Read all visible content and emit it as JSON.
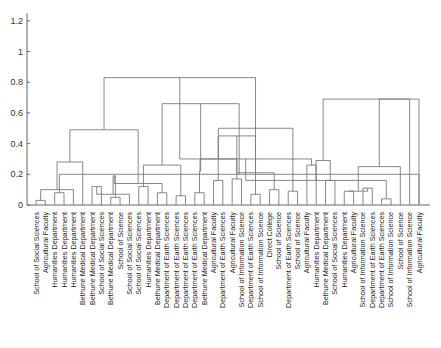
{
  "chart_data": {
    "type": "dendrogram",
    "title": "",
    "xlabel": "",
    "ylabel": "",
    "ylim": [
      0,
      1.25
    ],
    "yticks": [
      "0",
      "0.2",
      "0.4",
      "0.6",
      "0.8",
      "1",
      "1.2"
    ],
    "ytick_values": [
      0,
      0.2,
      0.4,
      0.6,
      0.8,
      1.0,
      1.2
    ],
    "grid": false,
    "leaves": [
      "School of Social Sciences",
      "Agricultural Faculty",
      "Humanities Department",
      "Humanities Department",
      "Humanities Department",
      "Bethune Medical Department",
      "Bethune Medical Department",
      "School of Social Sciences",
      "Bethune Medical Department",
      "School of Science",
      "School of Social Sciences",
      "School of Social Sciences",
      "Humanities Department",
      "Bethune Medical Department",
      "Department of Earth Sciences",
      "Department of Earth Sciences",
      "Department of Earth Sciences",
      "Department of Earth Sciences",
      "Bethune Medical Department",
      "Agricultural Faculty",
      "Department of Earth Sciences",
      "Agricultural Faculty",
      "School of Information Science",
      "Department of Earth Sciences",
      "School of Information Science",
      "Direct College",
      "School of Science",
      "Department of Earth Sciences",
      "School of Science",
      "Agricultural Faculty",
      "Humanities Department",
      "Bethune Medical Department",
      "School of Social Sciences",
      "Humanities Department",
      "Agricultural Faculty",
      "School of Information Science",
      "Department of Earth Sciences",
      "Department of Earth Sciences",
      "School of Information Science",
      "School of Science",
      "School of Information Science",
      "Agricultural Faculty"
    ],
    "links": [
      [
        0,
        1,
        0.03
      ],
      [
        2,
        3,
        0.08
      ],
      [
        42,
        4,
        0.1
      ],
      [
        41,
        43,
        0.2
      ],
      [
        44,
        5,
        0.28
      ],
      [
        6,
        7,
        0.12
      ],
      [
        8,
        9,
        0.05
      ],
      [
        47,
        10,
        0.07
      ],
      [
        11,
        12,
        0.12
      ],
      [
        48,
        49,
        0.19
      ],
      [
        13,
        14,
        0.08
      ],
      [
        15,
        16,
        0.06
      ],
      [
        51,
        52,
        0.14
      ],
      [
        50,
        53,
        0.26
      ],
      [
        46,
        54,
        0.49
      ],
      [
        45,
        55,
        0.66
      ],
      [
        17,
        18,
        0.08
      ],
      [
        19,
        20,
        0.16
      ],
      [
        57,
        58,
        0.22
      ],
      [
        21,
        22,
        0.17
      ],
      [
        23,
        24,
        0.07
      ],
      [
        60,
        61,
        0.3
      ],
      [
        59,
        62,
        0.45
      ],
      [
        25,
        26,
        0.1
      ],
      [
        27,
        28,
        0.09
      ],
      [
        64,
        65,
        0.21
      ],
      [
        63,
        66,
        0.5
      ],
      [
        56,
        67,
        0.83
      ],
      [
        29,
        30,
        0.26
      ],
      [
        31,
        32,
        0.16
      ],
      [
        69,
        70,
        0.3
      ],
      [
        33,
        34,
        0.09
      ],
      [
        35,
        36,
        0.11
      ],
      [
        37,
        38,
        0.04
      ],
      [
        73,
        74,
        0.09
      ],
      [
        72,
        75,
        0.16
      ],
      [
        76,
        39,
        0.25
      ],
      [
        71,
        77,
        0.29
      ],
      [
        78,
        40,
        0.69
      ],
      [
        79,
        41,
        0.69
      ]
    ]
  }
}
